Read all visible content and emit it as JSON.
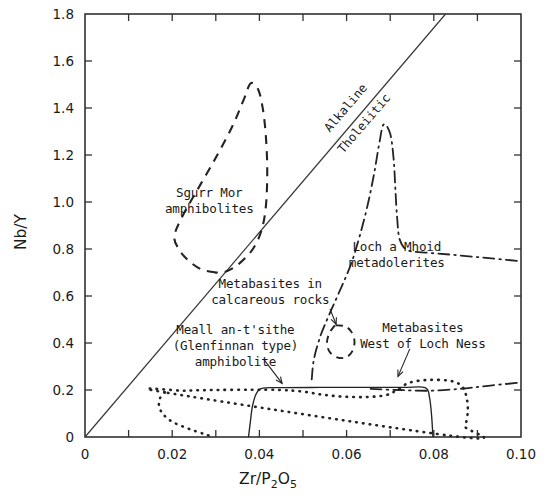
{
  "figure": {
    "title": "",
    "background": "#ffffff",
    "ink_color": "#232323"
  },
  "axes": {
    "x": {
      "title_main": "Zr/P",
      "title_sub1": "2",
      "title_mid": "O",
      "title_sub2": "5",
      "title_plain": "Zr/P2O5",
      "min": 0,
      "max": 0.1,
      "tick_step": 0.01,
      "labels": [
        "0",
        "0.02",
        "0.04",
        "0.06",
        "0.08",
        "0.10"
      ],
      "label_values": [
        0,
        0.02,
        0.04,
        0.06,
        0.08,
        0.1
      ]
    },
    "y": {
      "title": "Nb/Y",
      "min": 0,
      "max": 1.8,
      "tick_step": 0.2,
      "labels": [
        "0",
        "0.2",
        "0.4",
        "0.6",
        "0.8",
        "1.0",
        "1.2",
        "1.4",
        "1.6",
        "1.8"
      ],
      "label_values": [
        0,
        0.2,
        0.4,
        0.6,
        0.8,
        1.0,
        1.2,
        1.4,
        1.6,
        1.8
      ]
    }
  },
  "divider": {
    "name": "alkaline-tholeiitic-divider",
    "from": [
      0,
      0
    ],
    "to": [
      0.0827,
      1.8
    ],
    "label_upper": "Alkaline",
    "label_lower": "Tholeiitic"
  },
  "annotations": [
    {
      "id": "sgurr-mor",
      "lines": [
        "Sgurr Mor",
        "amphibolites"
      ],
      "x": 0.0285,
      "y": 1.02,
      "leader": false
    },
    {
      "id": "metabasites-calcareous",
      "lines": [
        "Metabasites in",
        "calcareous rocks"
      ],
      "x": 0.0425,
      "y": 0.635,
      "leader": true
    },
    {
      "id": "meall-an-tsithe",
      "lines": [
        "Meall an-t'sithe",
        "(Glenfinnan type)",
        "amphibolite"
      ],
      "x": 0.0345,
      "y": 0.44,
      "leader": true
    },
    {
      "id": "loch-a-mhoid",
      "lines": [
        "Loch a Mhoid",
        "metadolerites"
      ],
      "x": 0.0715,
      "y": 0.79,
      "leader": false
    },
    {
      "id": "metabasites-west-loch-ness",
      "lines": [
        "Metabasites",
        "West of Loch Ness"
      ],
      "x": 0.0775,
      "y": 0.445,
      "leader": true
    }
  ],
  "chart_data": {
    "type": "scatter",
    "title": "",
    "subtitle": "",
    "xlabel": "Zr/P2O5",
    "ylabel": "Nb/Y",
    "xlim": [
      0,
      0.1
    ],
    "ylim": [
      0,
      1.8
    ],
    "grid": false,
    "legend": "inline-annotations",
    "reference_lines": [
      {
        "name": "Alkaline / Tholeiitic divider",
        "style": "solid-thin",
        "points": [
          [
            0,
            0
          ],
          [
            0.0827,
            1.8
          ]
        ],
        "upper_field": "Alkaline",
        "lower_field": "Tholeiitic"
      }
    ],
    "series": [
      {
        "name": "Sgurr Mor amphibolites",
        "style": "dashed",
        "closed": true,
        "points": [
          [
            0.03,
            0.7
          ],
          [
            0.0265,
            0.715
          ],
          [
            0.0235,
            0.755
          ],
          [
            0.0215,
            0.8
          ],
          [
            0.0205,
            0.855
          ],
          [
            0.0225,
            0.945
          ],
          [
            0.0265,
            1.075
          ],
          [
            0.0305,
            1.205
          ],
          [
            0.034,
            1.33
          ],
          [
            0.0365,
            1.44
          ],
          [
            0.038,
            1.505
          ],
          [
            0.0397,
            1.48
          ],
          [
            0.0408,
            1.395
          ],
          [
            0.0415,
            1.275
          ],
          [
            0.0418,
            1.13
          ],
          [
            0.0415,
            0.985
          ],
          [
            0.0405,
            0.88
          ],
          [
            0.0385,
            0.8
          ],
          [
            0.0355,
            0.74
          ],
          [
            0.0325,
            0.705
          ],
          [
            0.03,
            0.7
          ]
        ]
      },
      {
        "name": "Metabasites in calcareous rocks",
        "style": "dashed",
        "closed": true,
        "points": [
          [
            0.0573,
            0.475
          ],
          [
            0.056,
            0.44
          ],
          [
            0.0555,
            0.398
          ],
          [
            0.0562,
            0.36
          ],
          [
            0.058,
            0.338
          ],
          [
            0.06,
            0.34
          ],
          [
            0.0614,
            0.368
          ],
          [
            0.0618,
            0.41
          ],
          [
            0.061,
            0.45
          ],
          [
            0.0595,
            0.472
          ],
          [
            0.0573,
            0.475
          ]
        ]
      },
      {
        "name": "Loch a Mhoid metadolerites",
        "style": "dash-dot",
        "closed": false,
        "points": [
          [
            0.052,
            0.245
          ],
          [
            0.0525,
            0.33
          ],
          [
            0.054,
            0.43
          ],
          [
            0.056,
            0.52
          ],
          [
            0.0585,
            0.625
          ],
          [
            0.061,
            0.735
          ],
          [
            0.063,
            0.855
          ],
          [
            0.0648,
            0.985
          ],
          [
            0.0663,
            1.12
          ],
          [
            0.0675,
            1.25
          ],
          [
            0.0685,
            1.33
          ],
          [
            0.07,
            1.29
          ],
          [
            0.0708,
            1.18
          ],
          [
            0.0712,
            1.05
          ],
          [
            0.0716,
            0.93
          ],
          [
            0.0722,
            0.84
          ],
          [
            0.074,
            0.795
          ],
          [
            0.078,
            0.785
          ],
          [
            0.0845,
            0.775
          ],
          [
            0.092,
            0.762
          ],
          [
            0.1,
            0.748
          ]
        ]
      },
      {
        "name": "Loch a Mhoid metadolerites (lower branch)",
        "style": "dash-dot",
        "closed": false,
        "points": [
          [
            0.0655,
            0.205
          ],
          [
            0.072,
            0.2
          ],
          [
            0.079,
            0.197
          ],
          [
            0.086,
            0.205
          ],
          [
            0.0925,
            0.218
          ],
          [
            0.1,
            0.232
          ]
        ]
      },
      {
        "name": "Meall an-t'sithe (Glenfinnan type) amphibolite",
        "style": "solid",
        "closed": false,
        "points": [
          [
            0.0375,
            0.0
          ],
          [
            0.0379,
            0.06
          ],
          [
            0.0384,
            0.13
          ],
          [
            0.0393,
            0.185
          ],
          [
            0.0408,
            0.208
          ],
          [
            0.045,
            0.21
          ],
          [
            0.054,
            0.211
          ],
          [
            0.064,
            0.211
          ],
          [
            0.073,
            0.211
          ],
          [
            0.078,
            0.21
          ],
          [
            0.079,
            0.17
          ],
          [
            0.0795,
            0.09
          ],
          [
            0.0798,
            0.0
          ]
        ]
      },
      {
        "name": "Metabasites West of Loch Ness",
        "style": "dotted",
        "closed": true,
        "points": [
          [
            0.0183,
            0.19
          ],
          [
            0.023,
            0.197
          ],
          [
            0.03,
            0.2
          ],
          [
            0.038,
            0.201
          ],
          [
            0.045,
            0.2
          ],
          [
            0.05,
            0.193
          ],
          [
            0.0545,
            0.18
          ],
          [
            0.059,
            0.172
          ],
          [
            0.064,
            0.17
          ],
          [
            0.069,
            0.178
          ],
          [
            0.072,
            0.205
          ],
          [
            0.0745,
            0.232
          ],
          [
            0.079,
            0.243
          ],
          [
            0.084,
            0.238
          ],
          [
            0.0865,
            0.215
          ],
          [
            0.0875,
            0.17
          ],
          [
            0.0878,
            0.11
          ],
          [
            0.0872,
            0.045
          ],
          [
            0.0862,
            0.0
          ]
        ]
      },
      {
        "name": "Metabasites West of Loch Ness (lower boundary)",
        "style": "dotted",
        "closed": false,
        "points": [
          [
            0.0183,
            0.19
          ],
          [
            0.0172,
            0.165
          ],
          [
            0.017,
            0.13
          ],
          [
            0.018,
            0.095
          ],
          [
            0.02,
            0.065
          ],
          [
            0.0228,
            0.042
          ],
          [
            0.0255,
            0.024
          ],
          [
            0.0278,
            0.01
          ],
          [
            0.0295,
            0.0
          ]
        ]
      }
    ]
  }
}
